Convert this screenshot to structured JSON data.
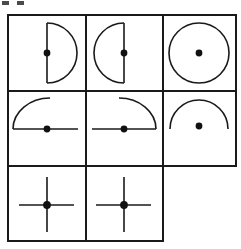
{
  "figure": {
    "layout": {
      "type": "irregular-grid",
      "columns": 3,
      "rows": 3,
      "note": "Third row has only two cells; the bottom-right cell is absent",
      "grid_left": 8,
      "grid_top": 15,
      "col_edges": [
        8,
        86,
        163,
        236
      ],
      "row_edges": [
        15,
        91,
        166,
        241
      ]
    },
    "style": {
      "stroke_color": "#1a1a1a",
      "background_color": "#ffffff",
      "border_width": 2,
      "figure_stroke_width": 1.6,
      "dot_color": "#111111",
      "dot_radius": 3.4
    },
    "cells": [
      {
        "id": "cell-1",
        "row": 1,
        "column": 1,
        "name": "semicircle-opening-left",
        "description": "Half disc outline bulging right with vertical diameter chord and centered dot",
        "dot": "on-chord-center"
      },
      {
        "id": "cell-2",
        "row": 1,
        "column": 2,
        "name": "semicircle-opening-right",
        "description": "Half disc outline bulging left with vertical diameter chord and centered dot",
        "dot": "on-chord-center"
      },
      {
        "id": "cell-3",
        "row": 1,
        "column": 3,
        "name": "full-circle",
        "description": "Complete circle outline with dot at its centre",
        "dot": "circle-center"
      },
      {
        "id": "cell-4",
        "row": 2,
        "column": 1,
        "name": "quarter-arc-upper-left-with-horizontal-line",
        "description": "Quarter arc curving from upper right down to left, joined to a horizontal line with a dot",
        "dot": "on-horizontal-line"
      },
      {
        "id": "cell-5",
        "row": 2,
        "column": 2,
        "name": "quarter-arc-upper-right-with-horizontal-line",
        "description": "Mirrored quarter arc curving from upper left down to right, joined to a horizontal line with a dot",
        "dot": "on-horizontal-line"
      },
      {
        "id": "cell-6",
        "row": 2,
        "column": 3,
        "name": "upper-semicircle-arc",
        "description": "Open arch shaped arc with no chord, dot floating at the centre below",
        "dot": "arc-center"
      },
      {
        "id": "cell-7",
        "row": 3,
        "column": 1,
        "name": "cross-with-center-dot",
        "description": "Vertical and horizontal lines crossing with a dot at the intersection",
        "dot": "intersection"
      },
      {
        "id": "cell-8",
        "row": 3,
        "column": 2,
        "name": "cross-with-center-dot",
        "description": "Vertical and horizontal lines crossing with a dot at the intersection",
        "dot": "intersection"
      },
      {
        "id": "cell-9",
        "row": 3,
        "column": 3,
        "name": "empty-missing-cell",
        "description": "No cell drawn in this position",
        "dot": "none"
      }
    ],
    "artifacts": [
      {
        "id": "artifact-1",
        "x": 2,
        "y": 1,
        "width": 7,
        "height": 4
      },
      {
        "id": "artifact-2",
        "x": 17,
        "y": 1,
        "width": 7,
        "height": 4
      }
    ]
  }
}
